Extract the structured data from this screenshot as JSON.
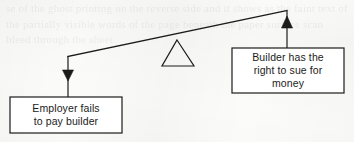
{
  "diagram": {
    "type": "seesaw-balance-diagram",
    "background_color": "#fbfbf9",
    "stroke_color": "#1b1b1b",
    "fill_color": "#ffffff",
    "fulcrum": {
      "name": "fulcrum-triangle",
      "apex": [
        177,
        40
      ],
      "base_left": [
        162,
        66
      ],
      "base_right": [
        194,
        66
      ]
    },
    "beam": {
      "name": "balance-beam",
      "left_end": [
        68,
        56
      ],
      "right_end": [
        287,
        10
      ],
      "tilt": "right side raised"
    },
    "left_branch": {
      "box_label_line1": "Employer fails",
      "box_label_line2": "to pay builder",
      "box_label": "Employer fails to pay builder",
      "arrow_direction": "down",
      "arrow_x": 68,
      "box_rect": [
        10,
        97,
        112,
        36
      ]
    },
    "right_branch": {
      "box_label_line1": "Builder has the",
      "box_label_line2": "right to sue for",
      "box_label_line3": "money",
      "box_label": "Builder has the right to sue for money",
      "arrow_direction": "up",
      "arrow_x": 287,
      "box_rect": [
        232,
        48,
        112,
        45
      ]
    }
  },
  "bleed_through": {
    "text": "se of the ghost printing on the reverse side and it shows as the faint text of the partially visible words of the page beneath the paper surface scan bleed through the sheet"
  }
}
